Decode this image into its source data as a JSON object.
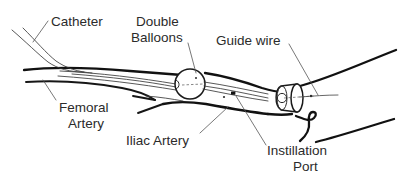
{
  "figure": {
    "background_color": "#ffffff",
    "ink_color": "#111111",
    "text_color": "#2b2b2b",
    "width": 410,
    "height": 175
  },
  "labels": {
    "catheter": "Catheter",
    "double_balloons_line1": "Double",
    "double_balloons_line2": "Balloons",
    "guide_wire": "Guide wire",
    "femoral_artery_line1": "Femoral",
    "femoral_artery_line2": "Artery",
    "iliac_artery": "Iliac Artery",
    "instillation_port_line1": "Instillation",
    "instillation_port_line2": "Port"
  },
  "parts": {
    "balloon_proximal": "proximal-balloon",
    "balloon_distal": "distal-balloon",
    "catheter_shaft": "catheter-shaft",
    "guide_wire_tip": "guide-wire-tip",
    "instillation_port_marker": "instillation-port-marker",
    "vessel_upper_wall": "artery-upper-wall",
    "vessel_lower_wall": "artery-lower-wall",
    "branch_wall": "artery-branch-wall"
  }
}
